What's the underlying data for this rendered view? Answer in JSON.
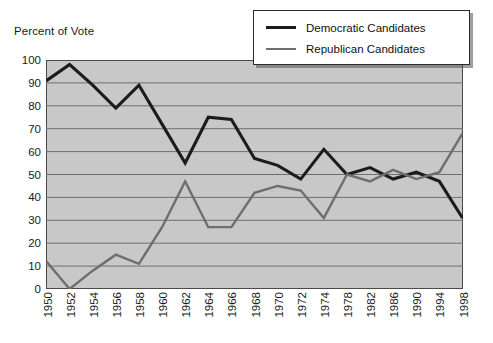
{
  "chart_data": {
    "type": "line",
    "title": "",
    "ylabel": "Percent of Vote",
    "xlabel": "",
    "ylim": [
      0,
      100
    ],
    "ytick_step": 10,
    "yticks": [
      0,
      10,
      20,
      30,
      40,
      50,
      60,
      70,
      80,
      90,
      100
    ],
    "grid": true,
    "legend_position": "top-right",
    "plot_background": "#c8c8c8",
    "categories": [
      "1950",
      "1952",
      "1954",
      "1956",
      "1958",
      "1960",
      "1962",
      "1964",
      "1966",
      "1968",
      "1970",
      "1972",
      "1974",
      "1978",
      "1982",
      "1986",
      "1990",
      "1994",
      "1998"
    ],
    "series": [
      {
        "name": "Democratic Candidates",
        "color": "#1c1c1c",
        "values": [
          91,
          98,
          89,
          79,
          89,
          72,
          55,
          75,
          74,
          57,
          54,
          48,
          61,
          50,
          53,
          48,
          51,
          47,
          31
        ]
      },
      {
        "name": "Republican Candidates",
        "color": "#6e6e6e",
        "values": [
          12,
          0,
          8,
          15,
          11,
          27,
          47,
          27,
          27,
          42,
          45,
          43,
          31,
          50,
          47,
          52,
          48,
          51,
          68
        ]
      }
    ]
  },
  "axis": {
    "y_title": "Percent of Vote"
  },
  "legend": {
    "items": [
      {
        "label": "Democratic Candidates",
        "color": "#1c1c1c"
      },
      {
        "label": "Republican Candidates",
        "color": "#6e6e6e"
      }
    ]
  }
}
